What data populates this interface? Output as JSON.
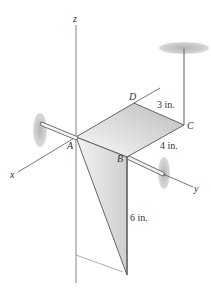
{
  "diagram": {
    "axes": {
      "x_label": "x",
      "y_label": "y",
      "z_label": "z"
    },
    "points": {
      "A": "A",
      "B": "B",
      "C": "C",
      "D": "D"
    },
    "dimensions": {
      "DC": "3 in.",
      "CB": "4 in.",
      "B_down": "6 in."
    },
    "colors": {
      "line": "#555555",
      "plate_light": "#f2f2f2",
      "plate_dark": "#bdbdbd",
      "bearing": "#b5b5b5"
    }
  }
}
